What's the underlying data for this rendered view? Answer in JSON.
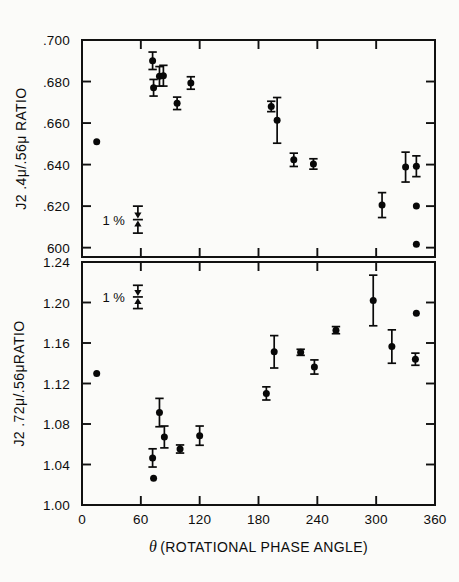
{
  "figure": {
    "background_color": "#fbfbf9",
    "ink_color": "#0a0a0a"
  },
  "xaxis": {
    "label_theta": "θ",
    "label_rest": "(ROTATIONAL PHASE ANGLE)",
    "ticks": [
      0,
      60,
      120,
      180,
      240,
      300,
      360
    ],
    "tick_labels": [
      "0",
      "60",
      "120",
      "180",
      "240",
      "300",
      "360"
    ],
    "min": 0,
    "max": 360
  },
  "panels": [
    {
      "id": "top",
      "ylabel": "J2 .4μ/.56μ RATIO",
      "ytick_labels": [
        ".700",
        ".680",
        ".660",
        ".640",
        ".620",
        "600"
      ],
      "yticks": [
        0.7,
        0.68,
        0.66,
        0.64,
        0.62,
        0.6
      ],
      "ymin": 0.5955,
      "ymax": 0.7,
      "scale_note": "1 %",
      "scale_marker": {
        "x": 57,
        "y_center": 0.6135,
        "half_height": 0.0065
      }
    },
    {
      "id": "bottom",
      "ylabel": "J2 .72μ/.56μRATIO",
      "ytick_labels": [
        "1.24",
        "1.20",
        "1.16",
        "1.12",
        "1.08",
        "1.04",
        "1.00"
      ],
      "yticks": [
        1.24,
        1.2,
        1.16,
        1.12,
        1.08,
        1.04,
        1.0
      ],
      "ymin": 1.0,
      "ymax": 1.24,
      "scale_note": "1 %",
      "scale_marker": {
        "x": 57,
        "y_center": 1.2055,
        "half_height": 0.0115
      }
    }
  ],
  "chart_data": [
    {
      "type": "scatter",
      "panel": "top",
      "title": "",
      "xlabel": "θ (ROTATIONAL PHASE ANGLE)",
      "ylabel": "J2 .4μ/.56μ RATIO",
      "xlim": [
        0,
        360
      ],
      "ylim": [
        0.5955,
        0.7
      ],
      "grid": false,
      "legend": "none",
      "x": [
        15,
        72,
        73,
        79,
        83,
        97,
        111,
        193,
        199,
        216,
        236,
        306,
        330,
        341,
        341,
        341
      ],
      "y": [
        0.651,
        0.69,
        0.677,
        0.6825,
        0.6828,
        0.6695,
        0.6793,
        0.668,
        0.6613,
        0.6423,
        0.6403,
        0.6205,
        0.6388,
        0.6392,
        0.62,
        0.6017
      ],
      "yerr": [
        0.0,
        0.0042,
        0.004,
        0.0047,
        0.005,
        0.003,
        0.003,
        0.0025,
        0.011,
        0.0032,
        0.0025,
        0.006,
        0.0072,
        0.005,
        0.0,
        0.0
      ]
    },
    {
      "type": "scatter",
      "panel": "bottom",
      "title": "",
      "xlabel": "θ (ROTATIONAL PHASE ANGLE)",
      "ylabel": "J2 .72μ/.56μRATIO",
      "xlim": [
        0,
        360
      ],
      "ylim": [
        1.0,
        1.24
      ],
      "grid": false,
      "legend": "none",
      "x": [
        15,
        72,
        73,
        79,
        84,
        100,
        120,
        188,
        196,
        223,
        237,
        259,
        297,
        316,
        340,
        341
      ],
      "y": [
        1.13,
        1.0465,
        1.0265,
        1.0913,
        1.0672,
        1.0553,
        1.0685,
        1.1102,
        1.1513,
        1.1508,
        1.1363,
        1.1727,
        1.202,
        1.1565,
        1.144,
        1.1893
      ],
      "yerr": [
        0.0,
        0.009,
        0.0,
        0.014,
        0.0108,
        0.004,
        0.0095,
        0.0065,
        0.016,
        0.003,
        0.007,
        0.0035,
        0.025,
        0.0165,
        0.006,
        0.0
      ]
    }
  ]
}
